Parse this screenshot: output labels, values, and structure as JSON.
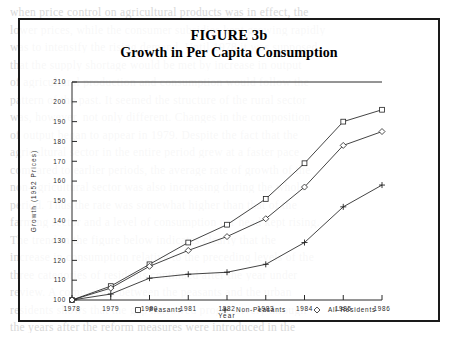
{
  "figure": {
    "number_label": "FIGURE 3b",
    "subtitle": "Growth in Per Capita Consumption"
  },
  "chart_data": {
    "type": "line",
    "title": "Growth in Per Capita Consumption",
    "xlabel": "Year",
    "ylabel": "Growth (1952 Prices)",
    "categories": [
      "1978",
      "1979",
      "1980",
      "1981",
      "1982",
      "1983",
      "1984",
      "1985",
      "1986"
    ],
    "x": [
      1978,
      1979,
      1980,
      1981,
      1982,
      1983,
      1984,
      1985,
      1986
    ],
    "xlim": [
      1978,
      1986
    ],
    "ylim": [
      100,
      210
    ],
    "yticks": [
      100,
      110,
      120,
      130,
      140,
      150,
      160,
      170,
      180,
      190,
      200,
      210
    ],
    "grid": false,
    "legend_position": "below",
    "series": [
      {
        "name": "Peasants",
        "marker": "square",
        "values": [
          100,
          107,
          118,
          129,
          138,
          151,
          169,
          190,
          196
        ]
      },
      {
        "name": "Non-Peasants",
        "marker": "plus",
        "values": [
          100,
          103,
          111,
          113,
          114,
          118,
          129,
          147,
          158
        ]
      },
      {
        "name": "All-Residents",
        "marker": "diamond",
        "values": [
          100,
          106,
          117,
          125,
          132,
          141,
          157,
          178,
          185
        ]
      }
    ]
  },
  "legend": {
    "items": [
      {
        "label": "Peasants",
        "marker": "square"
      },
      {
        "label": "Non-Peasants",
        "marker": "plus"
      },
      {
        "label": "All-Residents",
        "marker": "diamond"
      }
    ]
  },
  "colors": {
    "ink": "#222222",
    "frame": "#1a1a1a",
    "paper": "#ffffff"
  }
}
